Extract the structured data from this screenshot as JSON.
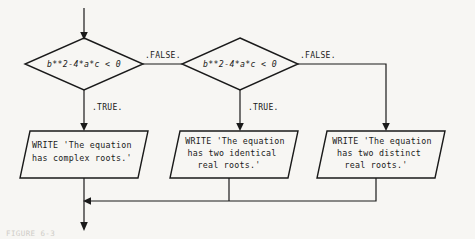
{
  "figure": {
    "caption": "FIGURE 6-3",
    "background_color": "#f7f6f3",
    "line_color": "#1a1a1a"
  },
  "decisions": [
    {
      "id": "discriminant-test-1",
      "condition": "b**2-4*a*c < 0",
      "true_label": ".TRUE.",
      "false_label": ".FALSE."
    },
    {
      "id": "discriminant-test-2",
      "condition": "b**2-4*a*c < 0",
      "true_label": ".TRUE.",
      "false_label": ".FALSE."
    }
  ],
  "output_boxes": [
    {
      "id": "complex-roots",
      "lines": [
        "WRITE 'The equation",
        "has complex roots.'"
      ]
    },
    {
      "id": "identical-real-roots",
      "lines": [
        "WRITE 'The equation",
        "has two identical",
        "real roots.'"
      ]
    },
    {
      "id": "distinct-real-roots",
      "lines": [
        "WRITE 'The equation",
        "has two distinct",
        "real roots.'"
      ]
    }
  ]
}
